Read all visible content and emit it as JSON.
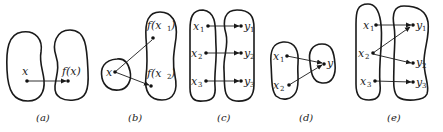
{
  "figure": {
    "panels": [
      {
        "id": "a",
        "caption": "(a)",
        "domain_labels": [
          "x"
        ],
        "codomain_labels": [
          "f(x)"
        ],
        "mappings": [
          [
            "x",
            "f(x)"
          ]
        ]
      },
      {
        "id": "b",
        "caption": "(b)",
        "domain_labels": [
          "x"
        ],
        "codomain_labels": [
          "f(x1)",
          "f(x2)"
        ],
        "mappings": [
          [
            "x",
            "f(x1)"
          ],
          [
            "x",
            "f(x2)"
          ]
        ]
      },
      {
        "id": "c",
        "caption": "(c)",
        "domain_labels": [
          "x1",
          "x2",
          "x3"
        ],
        "codomain_labels": [
          "y1",
          "y2",
          "y3"
        ],
        "mappings": [
          [
            "x1",
            "y1"
          ],
          [
            "x2",
            "y2"
          ],
          [
            "x3",
            "y3"
          ]
        ]
      },
      {
        "id": "d",
        "caption": "(d)",
        "domain_labels": [
          "x1",
          "x2"
        ],
        "codomain_labels": [
          "y"
        ],
        "mappings": [
          [
            "x1",
            "y"
          ],
          [
            "x2",
            "y"
          ]
        ]
      },
      {
        "id": "e",
        "caption": "(e)",
        "domain_labels": [
          "x1",
          "x2",
          "x3"
        ],
        "codomain_labels": [
          "y1",
          "y2",
          "y3"
        ],
        "mappings": [
          [
            "x1",
            "y1"
          ],
          [
            "x2",
            "y1"
          ],
          [
            "x2",
            "y2"
          ],
          [
            "x3",
            "y3"
          ]
        ]
      }
    ],
    "text": {
      "a_x": "x",
      "a_fx": "f(x)",
      "b_x": "x",
      "b_f": "f(x",
      "b_close": ")",
      "b_s1": "1",
      "b_s2": "2",
      "x": "x",
      "y": "y",
      "s1": "1",
      "s2": "2",
      "s3": "3",
      "cap_a": "(a)",
      "cap_b": "(b)",
      "cap_c": "(c)",
      "cap_d": "(d)",
      "cap_e": "(e)"
    }
  }
}
